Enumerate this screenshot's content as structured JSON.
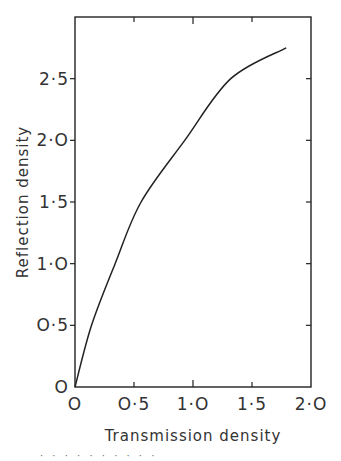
{
  "chart_data": {
    "type": "line",
    "title": "",
    "xlabel": "Transmission density",
    "ylabel": "Reflection density",
    "xlim": [
      0,
      2.0
    ],
    "ylim": [
      0,
      3.0
    ],
    "grid": false,
    "legend": null,
    "x_ticks": [
      0,
      0.5,
      1.0,
      1.5,
      2.0
    ],
    "x_tick_labels": [
      "O",
      "O·5",
      "1·O",
      "1·5",
      "2·O"
    ],
    "y_ticks": [
      0,
      0.5,
      1.0,
      1.5,
      2.0,
      2.5
    ],
    "y_tick_labels": [
      "O",
      "O·5",
      "1·O",
      "1·5",
      "2·O",
      "2·5"
    ],
    "series": [
      {
        "name": "Reflection vs transmission density",
        "x": [
          0,
          0.14,
          0.34,
          0.56,
          0.93,
          1.32,
          1.79
        ],
        "y": [
          0,
          0.5,
          1.0,
          1.5,
          2.0,
          2.5,
          2.75
        ]
      }
    ]
  },
  "caption_fragment": "· · · · · · · · · ·"
}
